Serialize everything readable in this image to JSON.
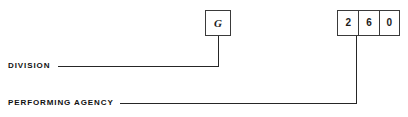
{
  "diagram": {
    "line_color": "#262626",
    "box_border_color": "#3a3a3a",
    "text_color": "#111111",
    "background": "#ffffff"
  },
  "fields": [
    {
      "id": "division",
      "label": "DIVISION",
      "cells": [
        {
          "value": "G"
        }
      ]
    },
    {
      "id": "performing_agency",
      "label": "PERFORMING AGENCY",
      "cells": [
        {
          "value": "2"
        },
        {
          "value": "6"
        },
        {
          "value": "0"
        }
      ]
    }
  ]
}
